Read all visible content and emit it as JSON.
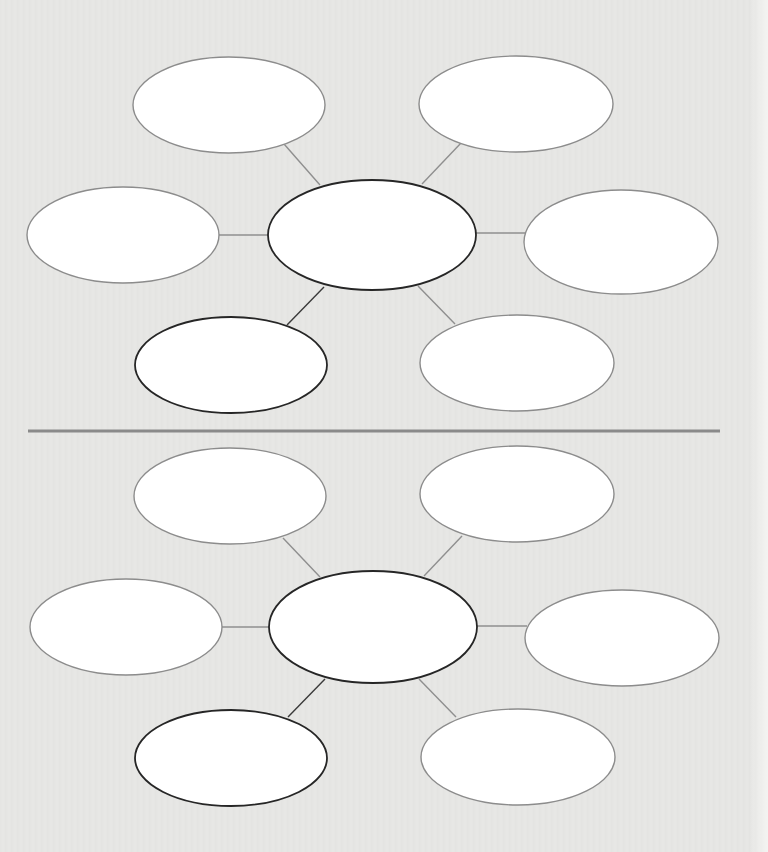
{
  "worksheet": {
    "type": "blank bubble map graphic organizer",
    "colors": {
      "background": "#e8e8e6",
      "bubble_fill": "#ffffff",
      "outer_stroke": "#8c8c8c",
      "dark_stroke": "#262626",
      "connector": "#8f8f8f",
      "dark_connector": "#3a3a3a",
      "divider": "#8a8a8a"
    },
    "divider": {
      "x1": 28,
      "x2": 720,
      "y": 431,
      "width": 3
    },
    "maps": [
      {
        "name": "top-bubble-map",
        "center": {
          "cx": 372,
          "cy": 235,
          "rx": 104,
          "ry": 55,
          "dark": true,
          "text": ""
        },
        "bubbles": [
          {
            "name": "top-left",
            "cx": 229,
            "cy": 105,
            "rx": 96,
            "ry": 48,
            "dark": false,
            "text": "",
            "lx1": 284,
            "ly1": 144,
            "lx2": 320,
            "ly2": 185,
            "ldark": false
          },
          {
            "name": "top-right",
            "cx": 516,
            "cy": 104,
            "rx": 97,
            "ry": 48,
            "dark": false,
            "text": "",
            "lx1": 461,
            "ly1": 143,
            "lx2": 422,
            "ly2": 184,
            "ldark": false
          },
          {
            "name": "left",
            "cx": 123,
            "cy": 235,
            "rx": 96,
            "ry": 48,
            "dark": false,
            "text": "",
            "lx1": 219,
            "ly1": 235,
            "lx2": 268,
            "ly2": 235,
            "ldark": false
          },
          {
            "name": "right",
            "cx": 621,
            "cy": 242,
            "rx": 97,
            "ry": 52,
            "dark": false,
            "text": "",
            "lx1": 476,
            "ly1": 233,
            "lx2": 525,
            "ly2": 233,
            "ldark": false
          },
          {
            "name": "bottom-left",
            "cx": 231,
            "cy": 365,
            "rx": 96,
            "ry": 48,
            "dark": true,
            "text": "",
            "lx1": 324,
            "ly1": 287,
            "lx2": 287,
            "ly2": 325,
            "ldark": true
          },
          {
            "name": "bottom-right",
            "cx": 517,
            "cy": 363,
            "rx": 97,
            "ry": 48,
            "dark": false,
            "text": "",
            "lx1": 418,
            "ly1": 286,
            "lx2": 455,
            "ly2": 324,
            "ldark": false
          }
        ]
      },
      {
        "name": "bottom-bubble-map",
        "center": {
          "cx": 373,
          "cy": 627,
          "rx": 104,
          "ry": 56,
          "dark": true,
          "text": ""
        },
        "bubbles": [
          {
            "name": "top-left",
            "cx": 230,
            "cy": 496,
            "rx": 96,
            "ry": 48,
            "dark": false,
            "text": "",
            "lx1": 283,
            "ly1": 538,
            "lx2": 320,
            "ly2": 577,
            "ldark": false
          },
          {
            "name": "top-right",
            "cx": 517,
            "cy": 494,
            "rx": 97,
            "ry": 48,
            "dark": false,
            "text": "",
            "lx1": 462,
            "ly1": 536,
            "lx2": 424,
            "ly2": 576,
            "ldark": false
          },
          {
            "name": "left",
            "cx": 126,
            "cy": 627,
            "rx": 96,
            "ry": 48,
            "dark": false,
            "text": "",
            "lx1": 222,
            "ly1": 627,
            "lx2": 269,
            "ly2": 627,
            "ldark": false
          },
          {
            "name": "right",
            "cx": 622,
            "cy": 638,
            "rx": 97,
            "ry": 48,
            "dark": false,
            "text": "",
            "lx1": 477,
            "ly1": 626,
            "lx2": 527,
            "ly2": 626,
            "ldark": false
          },
          {
            "name": "bottom-left",
            "cx": 231,
            "cy": 758,
            "rx": 96,
            "ry": 48,
            "dark": true,
            "text": "",
            "lx1": 325,
            "ly1": 679,
            "lx2": 288,
            "ly2": 717,
            "ldark": true
          },
          {
            "name": "bottom-right",
            "cx": 518,
            "cy": 757,
            "rx": 97,
            "ry": 48,
            "dark": false,
            "text": "",
            "lx1": 419,
            "ly1": 679,
            "lx2": 456,
            "ly2": 717,
            "ldark": false
          }
        ]
      }
    ]
  }
}
